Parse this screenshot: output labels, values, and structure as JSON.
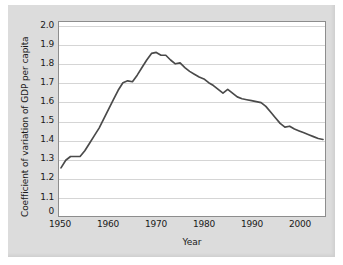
{
  "chart_data": {
    "type": "line",
    "title": "",
    "xlabel": "Year",
    "ylabel": "Coefficient of variation of GDP per capita",
    "xlim": [
      1950,
      2005
    ],
    "ylim": [
      1.1,
      2.0
    ],
    "grid": true,
    "legend": "none",
    "y_axis_broken_at_bottom": true,
    "x_tick_labels": [
      "1950",
      "1960",
      "1970",
      "1980",
      "1990",
      "2000"
    ],
    "x_ticks": [
      1950,
      1960,
      1970,
      1980,
      1990,
      2000
    ],
    "y_tick_labels": [
      "2.0",
      "1.9",
      "1.8",
      "1.7",
      "1.6",
      "1.5",
      "1.4",
      "1.3",
      "1.2",
      "1.1",
      "0"
    ],
    "y_ticks": [
      2.0,
      1.9,
      1.8,
      1.7,
      1.6,
      1.5,
      1.4,
      1.3,
      1.2,
      1.1
    ],
    "line_color": "#4a4a4a",
    "plot_background": "#ffffff",
    "panel_background": "#dcdcdc",
    "gridline_color": "#d5d5d5",
    "series": [
      {
        "name": "Coefficient of variation of GDP per capita",
        "x": [
          1950,
          1951,
          1952,
          1953,
          1954,
          1955,
          1956,
          1957,
          1958,
          1959,
          1960,
          1961,
          1962,
          1963,
          1964,
          1965,
          1966,
          1967,
          1968,
          1969,
          1970,
          1971,
          1972,
          1973,
          1974,
          1975,
          1976,
          1977,
          1978,
          1979,
          1980,
          1981,
          1982,
          1983,
          1984,
          1985,
          1986,
          1987,
          1988,
          1989,
          1990,
          1991,
          1992,
          1993,
          1994,
          1995,
          1996,
          1997,
          1998,
          1999,
          2000,
          2001,
          2002,
          2003,
          2004,
          2005
        ],
        "values": [
          1.25,
          1.29,
          1.31,
          1.31,
          1.31,
          1.34,
          1.38,
          1.42,
          1.46,
          1.51,
          1.56,
          1.61,
          1.66,
          1.7,
          1.71,
          1.705,
          1.74,
          1.78,
          1.82,
          1.855,
          1.86,
          1.845,
          1.845,
          1.82,
          1.8,
          1.805,
          1.78,
          1.76,
          1.745,
          1.73,
          1.72,
          1.7,
          1.685,
          1.665,
          1.645,
          1.665,
          1.645,
          1.625,
          1.615,
          1.61,
          1.605,
          1.6,
          1.595,
          1.575,
          1.545,
          1.515,
          1.485,
          1.465,
          1.47,
          1.455,
          1.445,
          1.435,
          1.425,
          1.415,
          1.405,
          1.4
        ]
      }
    ]
  }
}
